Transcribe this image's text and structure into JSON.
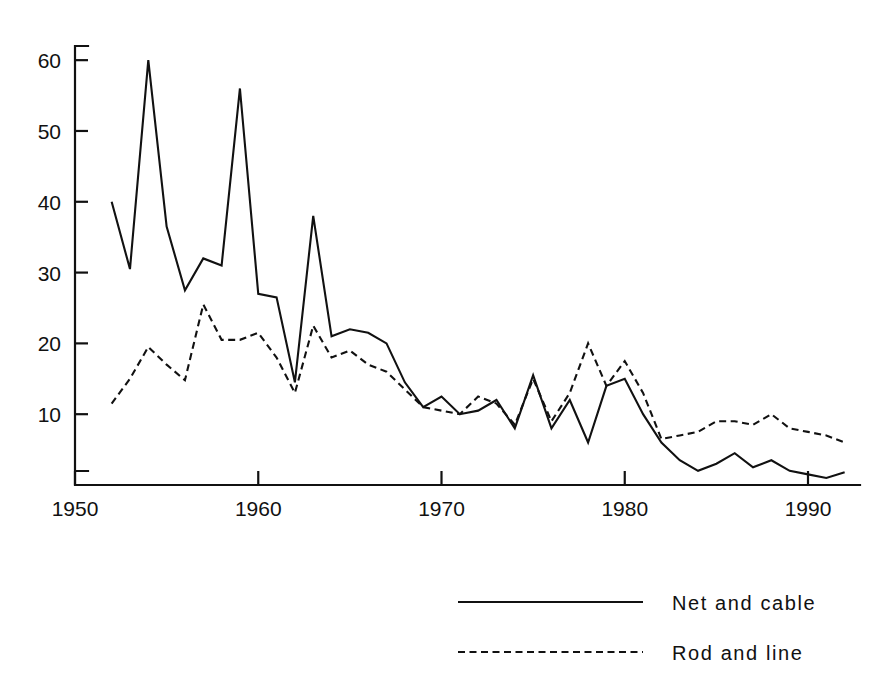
{
  "chart_data": {
    "type": "line",
    "title": "",
    "subtitle": "",
    "xlabel": "",
    "ylabel": "",
    "xlim": [
      1950,
      1992.5
    ],
    "ylim": [
      0,
      62
    ],
    "grid": false,
    "legend_position": "bottom-right",
    "x_ticks": [
      "1950",
      "1960",
      "1970",
      "1980",
      "1990"
    ],
    "x_tick_values": [
      1950,
      1960,
      1970,
      1980,
      1990
    ],
    "y_ticks": [
      "10",
      "20",
      "30",
      "40",
      "50",
      "60"
    ],
    "y_tick_values": [
      10,
      20,
      30,
      40,
      50,
      60
    ],
    "x": [
      1952,
      1953,
      1954,
      1955,
      1956,
      1957,
      1958,
      1959,
      1960,
      1961,
      1962,
      1963,
      1964,
      1965,
      1966,
      1967,
      1968,
      1969,
      1970,
      1971,
      1972,
      1973,
      1974,
      1975,
      1976,
      1977,
      1978,
      1979,
      1980,
      1981,
      1982,
      1983,
      1984,
      1985,
      1986,
      1987,
      1988,
      1989,
      1990,
      1991,
      1992
    ],
    "series": [
      {
        "name": "Net and cable",
        "style": "solid",
        "color": "#111111",
        "values": [
          40.0,
          30.5,
          60.0,
          36.5,
          27.5,
          32.0,
          31.0,
          56.0,
          27.0,
          26.5,
          14.5,
          38.0,
          21.0,
          22.0,
          21.5,
          20.0,
          14.5,
          11.0,
          12.5,
          10.0,
          10.5,
          12.0,
          8.0,
          15.5,
          8.0,
          12.0,
          6.0,
          14.0,
          15.0,
          10.0,
          6.0,
          3.5,
          2.0,
          3.0,
          4.5,
          2.5,
          3.5,
          2.0,
          1.5,
          1.0,
          1.8
        ]
      },
      {
        "name": "Rod and line",
        "style": "dashed",
        "color": "#111111",
        "values": [
          11.5,
          15.0,
          19.5,
          17.0,
          14.8,
          25.5,
          20.5,
          20.5,
          21.5,
          18.0,
          13.0,
          22.5,
          18.0,
          19.0,
          17.0,
          16.0,
          13.5,
          11.0,
          10.5,
          10.0,
          12.5,
          11.5,
          8.5,
          15.0,
          9.0,
          13.0,
          20.0,
          14.0,
          17.5,
          13.0,
          6.5,
          7.0,
          7.5,
          9.0,
          9.0,
          8.5,
          10.0,
          8.0,
          7.5,
          7.0,
          6.0
        ]
      }
    ]
  },
  "legend": {
    "items": [
      {
        "label": "Net and cable",
        "style": "solid"
      },
      {
        "label": "Rod and line",
        "style": "dashed"
      }
    ]
  }
}
